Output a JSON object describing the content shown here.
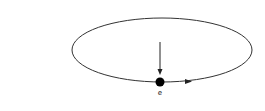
{
  "diagram": {
    "orbit": {
      "cx": 162,
      "cy": 50,
      "rx": 90,
      "ry": 32,
      "stroke": "#333333"
    },
    "particle": {
      "cx": 160,
      "cy": 82,
      "r": 4.5,
      "color": "#000000",
      "label": "e"
    },
    "force_arrow": {
      "x": 160,
      "y1": 42,
      "y2": 75,
      "direction": "down"
    },
    "velocity_arrow": {
      "x": 190,
      "y": 81.5,
      "direction": "right"
    }
  }
}
